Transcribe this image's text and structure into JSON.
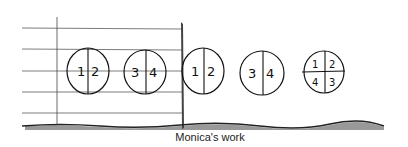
{
  "figure": {
    "caption": "Monica's work",
    "circles": [
      {
        "type": "halves",
        "labels": [
          "1",
          "2"
        ]
      },
      {
        "type": "halves",
        "labels": [
          "3",
          "4"
        ]
      },
      {
        "type": "halves",
        "labels": [
          "1",
          "2"
        ]
      },
      {
        "type": "halves",
        "labels": [
          "3",
          "4"
        ]
      },
      {
        "type": "quarters",
        "labels": [
          "1",
          "2",
          "4",
          "3"
        ]
      }
    ]
  }
}
